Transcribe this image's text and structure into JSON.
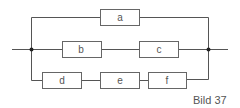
{
  "diagram": {
    "type": "reliability-block-diagram",
    "caption": "Bild 37",
    "blocks": [
      {
        "id": "a",
        "label": "a",
        "branch": 1
      },
      {
        "id": "b",
        "label": "b",
        "branch": 2
      },
      {
        "id": "c",
        "label": "c",
        "branch": 2
      },
      {
        "id": "d",
        "label": "d",
        "branch": 3
      },
      {
        "id": "e",
        "label": "e",
        "branch": 3
      },
      {
        "id": "f",
        "label": "f",
        "branch": 3
      }
    ],
    "branches": [
      {
        "name": "upper",
        "series": [
          "a"
        ]
      },
      {
        "name": "middle",
        "series": [
          "b",
          "c"
        ]
      },
      {
        "name": "lower",
        "series": [
          "d",
          "e",
          "f"
        ]
      }
    ],
    "structure": "parallel connection of three series branches",
    "colors": {
      "line": "#555555",
      "box": "#666666",
      "node": "#222222",
      "text": "#555555"
    }
  }
}
